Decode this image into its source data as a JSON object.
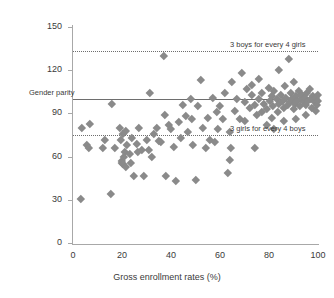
{
  "chart_data": {
    "type": "scatter",
    "title": "",
    "xlabel": "Gross enrollment rates (%)",
    "ylabel": "",
    "xlim": [
      0,
      100
    ],
    "ylim": [
      0,
      150
    ],
    "xticks": [
      0,
      20,
      40,
      60,
      80,
      100
    ],
    "yticks": [
      0,
      30,
      60,
      90,
      120,
      150
    ],
    "grid": false,
    "legend": "none",
    "marker_color": "#8a8a8a",
    "marker_shape": "diamond",
    "reference_lines": [
      {
        "name": "gender-parity",
        "value": 100,
        "style": "solid",
        "label": "Gender parity",
        "label_side": "left"
      },
      {
        "name": "three-boys-four-girls",
        "value": 133,
        "style": "dotted",
        "label": "3 boys for every 4 girls",
        "label_side": "right"
      },
      {
        "name": "three-girls-four-boys",
        "value": 75,
        "style": "dotted",
        "label": "3 girls for every 4 boys",
        "label_side": "right"
      }
    ],
    "points": [
      [
        3,
        31
      ],
      [
        3.5,
        80
      ],
      [
        5.5,
        68
      ],
      [
        6.5,
        66
      ],
      [
        7,
        83
      ],
      [
        12,
        66
      ],
      [
        13,
        72
      ],
      [
        15.5,
        34
      ],
      [
        16,
        97
      ],
      [
        17,
        66
      ],
      [
        19,
        80
      ],
      [
        19.5,
        72
      ],
      [
        20,
        57
      ],
      [
        20,
        56
      ],
      [
        20.2,
        55
      ],
      [
        20.5,
        76
      ],
      [
        20.8,
        60
      ],
      [
        21,
        63
      ],
      [
        21.5,
        53
      ],
      [
        21.5,
        78
      ],
      [
        22,
        68
      ],
      [
        23,
        62
      ],
      [
        23.5,
        56
      ],
      [
        24,
        73
      ],
      [
        25,
        47
      ],
      [
        26,
        69
      ],
      [
        26.5,
        63
      ],
      [
        27,
        80
      ],
      [
        28,
        65
      ],
      [
        29,
        47
      ],
      [
        30,
        72
      ],
      [
        31,
        65
      ],
      [
        31.5,
        104
      ],
      [
        32,
        60
      ],
      [
        33,
        76
      ],
      [
        34,
        80
      ],
      [
        35,
        71
      ],
      [
        36,
        70
      ],
      [
        37,
        130
      ],
      [
        37.5,
        89
      ],
      [
        38,
        47
      ],
      [
        39,
        82
      ],
      [
        40,
        79
      ],
      [
        41,
        67
      ],
      [
        42,
        43
      ],
      [
        43,
        84
      ],
      [
        44,
        73
      ],
      [
        45,
        96
      ],
      [
        46,
        88
      ],
      [
        47,
        77
      ],
      [
        48,
        100
      ],
      [
        48.5,
        86
      ],
      [
        49,
        68
      ],
      [
        50,
        44
      ],
      [
        51,
        95
      ],
      [
        52,
        113
      ],
      [
        53,
        80
      ],
      [
        54,
        66
      ],
      [
        55,
        87
      ],
      [
        56,
        72
      ],
      [
        57,
        101
      ],
      [
        58,
        70
      ],
      [
        58.5,
        91
      ],
      [
        59,
        79
      ],
      [
        60,
        95
      ],
      [
        61,
        86
      ],
      [
        62,
        104
      ],
      [
        63,
        49
      ],
      [
        64,
        77
      ],
      [
        64.5,
        66
      ],
      [
        65,
        112
      ],
      [
        66,
        92
      ],
      [
        67,
        100
      ],
      [
        68,
        86
      ],
      [
        69,
        118
      ],
      [
        70,
        98
      ],
      [
        71,
        107
      ],
      [
        72,
        94
      ],
      [
        73,
        103
      ],
      [
        74,
        96
      ],
      [
        75,
        89
      ],
      [
        76,
        100
      ],
      [
        77,
        104
      ],
      [
        78,
        97
      ],
      [
        79,
        93
      ],
      [
        80,
        108
      ],
      [
        80.5,
        99
      ],
      [
        81,
        102
      ],
      [
        81.5,
        95
      ],
      [
        82,
        106
      ],
      [
        83,
        100
      ],
      [
        83.5,
        91
      ],
      [
        84,
        97
      ],
      [
        85,
        103
      ],
      [
        85.5,
        99
      ],
      [
        86,
        94
      ],
      [
        86.5,
        109
      ],
      [
        87,
        101
      ],
      [
        87.5,
        96
      ],
      [
        88,
        128
      ],
      [
        88.5,
        98
      ],
      [
        89,
        104
      ],
      [
        89.5,
        100
      ],
      [
        90,
        93
      ],
      [
        90.5,
        97
      ],
      [
        91,
        102
      ],
      [
        91.5,
        99
      ],
      [
        92,
        106
      ],
      [
        92.5,
        95
      ],
      [
        93,
        100
      ],
      [
        93.5,
        103
      ],
      [
        94,
        98
      ],
      [
        94.5,
        101
      ],
      [
        95,
        96
      ],
      [
        95.5,
        104
      ],
      [
        96,
        99
      ],
      [
        96.5,
        107
      ],
      [
        97,
        100
      ],
      [
        97.5,
        94
      ],
      [
        98,
        102
      ],
      [
        98.5,
        98
      ],
      [
        99,
        101
      ],
      [
        99.5,
        96
      ],
      [
        100,
        99
      ],
      [
        100,
        103
      ],
      [
        84,
        120
      ],
      [
        76,
        114
      ],
      [
        79,
        82
      ],
      [
        82,
        79
      ],
      [
        74,
        66
      ],
      [
        91,
        86
      ],
      [
        95,
        89
      ],
      [
        99,
        92
      ],
      [
        86,
        85
      ],
      [
        90,
        112
      ],
      [
        64,
        58
      ],
      [
        70,
        85
      ],
      [
        73,
        110
      ],
      [
        77,
        91
      ],
      [
        81,
        87
      ]
    ]
  }
}
